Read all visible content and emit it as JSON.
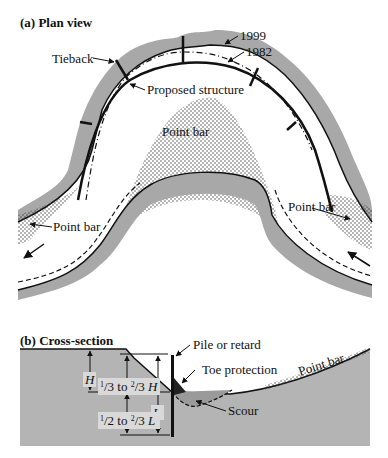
{
  "panel_a": {
    "title": "(a) Plan view",
    "labels": {
      "year_1999": "1999",
      "year_1982": "1982",
      "tieback": "Tieback",
      "proposed_structure": "Proposed structure",
      "point_bar_center": "Point bar",
      "point_bar_left": "Point bar",
      "point_bar_right": "Point bar"
    },
    "flow_arrows": [
      "flow-arrow-left",
      "flow-arrow-right"
    ]
  },
  "panel_b": {
    "title": "(b) Cross-section",
    "labels": {
      "pile": "Pile or retard",
      "toe": "Toe protection",
      "scour": "Scour",
      "point_bar": "Point bar",
      "H": "H",
      "L": "L",
      "third_prefix": "1",
      "third_mid": "/3 to ",
      "third_num2": "2",
      "third_den2": "/3",
      "third_suffix": " H",
      "half_prefix": "1",
      "half_mid": "/2 to ",
      "half_num2": "2",
      "half_den2": "/3",
      "half_suffix": " L"
    }
  },
  "colors": {
    "bank_gray": "#a8a8a8",
    "ground_gray": "#b4b4b4",
    "line": "#111111",
    "label_box": "#d9d9d9"
  }
}
